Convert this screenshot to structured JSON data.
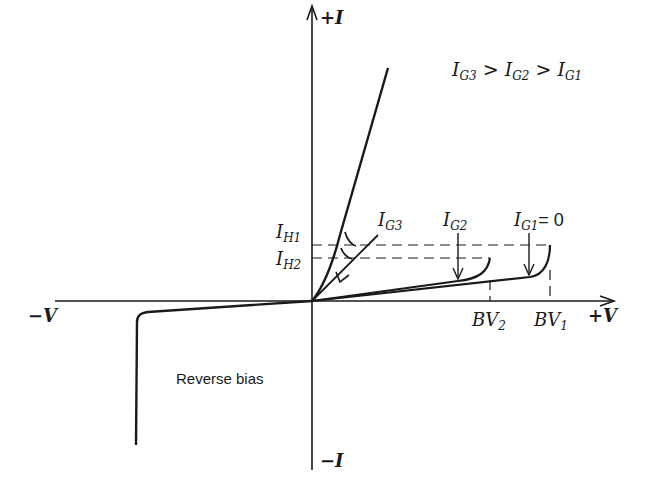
{
  "diagram": {
    "axes": {
      "y_pos_label": "+I",
      "y_neg_label": "−I",
      "x_pos_label": "+V",
      "x_neg_label": "−V"
    },
    "relation": {
      "text_parts": [
        "I",
        "G3",
        " > ",
        "I",
        "G2",
        " > ",
        "I",
        "G1"
      ]
    },
    "labels": {
      "ih1_main": "I",
      "ih1_sub": "H1",
      "ih2_main": "I",
      "ih2_sub": "H2",
      "ig3_main": "I",
      "ig3_sub": "G3",
      "ig2_main": "I",
      "ig2_sub": "G2",
      "ig1_main": "I",
      "ig1_sub": "G1",
      "ig1_suffix": "= 0",
      "bv2_main": "BV",
      "bv2_sub": "2",
      "bv1_main": "BV",
      "bv1_sub": "1",
      "reverse_bias": "Reverse bias"
    },
    "colors": {
      "ink": "#1a1a1a",
      "background": "#ffffff"
    }
  }
}
